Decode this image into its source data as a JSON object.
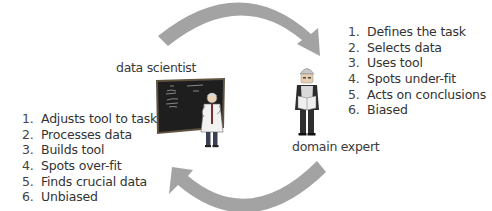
{
  "colors": {
    "arrow": "#a3a3a3",
    "text": "#333333",
    "chalkboard": "#1c1c1c",
    "chalkboard_frame": "#6b5a3a",
    "background": "#ffffff"
  },
  "arrows": [
    {
      "name": "top-arrow",
      "direction": "clockwise",
      "from": "data scientist",
      "to": "domain expert"
    },
    {
      "name": "bottom-arrow",
      "direction": "clockwise",
      "from": "domain expert",
      "to": "data scientist"
    }
  ],
  "data_scientist": {
    "label": "data scientist",
    "icon": "scientist-at-chalkboard-icon",
    "items": [
      {
        "num": "1.",
        "text": "Adjusts tool to task"
      },
      {
        "num": "2.",
        "text": "Processes data"
      },
      {
        "num": "3.",
        "text": "Builds tool"
      },
      {
        "num": "4.",
        "text": "Spots over-fit"
      },
      {
        "num": "5.",
        "text": "Finds crucial data"
      },
      {
        "num": "6.",
        "text": "Unbiased"
      }
    ]
  },
  "domain_expert": {
    "label": "domain expert",
    "icon": "worker-with-hardhat-icon",
    "items": [
      {
        "num": "1.",
        "text": "Defines the task"
      },
      {
        "num": "2.",
        "text": "Selects data"
      },
      {
        "num": "3.",
        "text": "Uses tool"
      },
      {
        "num": "4.",
        "text": "Spots under-fit"
      },
      {
        "num": "5.",
        "text": "Acts on conclusions"
      },
      {
        "num": "6.",
        "text": "Biased"
      }
    ]
  }
}
